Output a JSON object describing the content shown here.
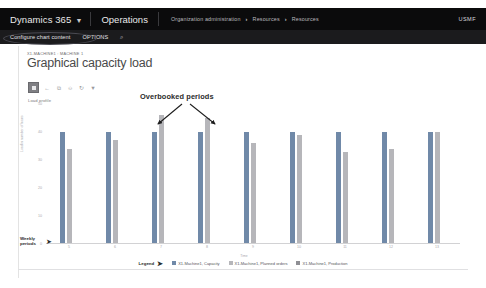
{
  "nav": {
    "brand": "Dynamics 365",
    "caret_icon": "chevron-down-icon",
    "module": "Operations",
    "breadcrumb": [
      "Organization administration",
      "Resources",
      "Resources"
    ],
    "separator": "›",
    "company": "USMF"
  },
  "action_pane": {
    "configure": "Configure chart content",
    "options": "OPTIONS",
    "search_icon": "⌕"
  },
  "page": {
    "caption": "X1-MACHINE1 : MACHINE 1",
    "title": "Graphical capacity load"
  },
  "chart_toolbar": {
    "items": [
      {
        "name": "chart-select-button",
        "glyph": ""
      },
      {
        "name": "zoom-out-icon",
        "glyph": "←"
      },
      {
        "name": "copy-icon",
        "glyph": "⧉"
      },
      {
        "name": "print-icon",
        "glyph": "⎙"
      },
      {
        "name": "refresh-icon",
        "glyph": "↻"
      },
      {
        "name": "filter-icon",
        "glyph": "▼"
      }
    ]
  },
  "load_profile_label": "Load profile",
  "annotations": {
    "overbooked": "Overbooked periods",
    "weekly_periods": "Weekly\nperiods",
    "weekly_periods_line1": "Weekly",
    "weekly_periods_line2": "periods",
    "arrow_right": "➤",
    "legend_label": "Legend",
    "legend_arrow": "➤"
  },
  "colors": {
    "capacity": "#7089a8",
    "planned_orders": "#b6b6ba",
    "production": "#8f8f94",
    "nav_background": "#0b0b0c",
    "action_pane_background": "#1b1b1d"
  },
  "chart_data": {
    "type": "bar",
    "title": "Load profile",
    "xlabel": "Time",
    "ylabel": "Load in number of hours",
    "categories": [
      "5",
      "6",
      "7",
      "8",
      "9",
      "10",
      "11",
      "12",
      "13"
    ],
    "ylim": [
      0,
      50
    ],
    "yticks": [
      "50",
      "40",
      "30",
      "20",
      "10",
      "0"
    ],
    "grid": false,
    "legend_position": "bottom",
    "series": [
      {
        "name": "X1-Machine1, Capacity",
        "color": "#7089a8",
        "values": [
          40,
          40,
          40,
          40,
          40,
          40,
          40,
          40,
          40
        ]
      },
      {
        "name": "X1-Machine1, Planned orders",
        "color": "#b6b6ba",
        "values": [
          34,
          37,
          46,
          45,
          36,
          39,
          33,
          34,
          40
        ]
      },
      {
        "name": "X1-Machine1, Production",
        "color": "#8f8f94",
        "values": [
          0,
          0,
          0,
          0,
          0,
          0,
          0,
          0,
          0
        ]
      }
    ]
  }
}
